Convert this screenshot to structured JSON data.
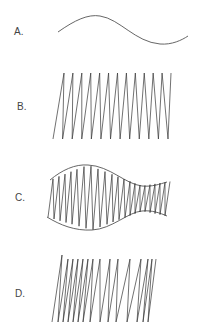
{
  "figure": {
    "panels": [
      {
        "label": "A.",
        "description": "single smooth wave curve"
      },
      {
        "label": "B.",
        "description": "regular zigzag with uniform spacing"
      },
      {
        "label": "C.",
        "description": "zigzag bounded by wavy envelope"
      },
      {
        "label": "D.",
        "description": "zigzag with irregular spacing"
      }
    ]
  }
}
